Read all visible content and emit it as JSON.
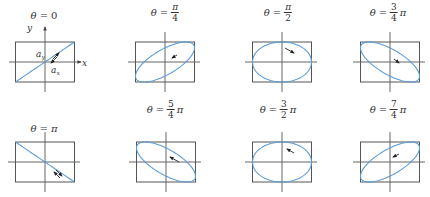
{
  "diagram": {
    "colors": {
      "frame": "#555555",
      "axis": "#555555",
      "curve": "#5b9bd5",
      "arrow": "#222222",
      "text": "#333333"
    },
    "axis_labels": {
      "x": "x",
      "y": "y",
      "ax": "a",
      "ax_sub": "x",
      "ay": "a",
      "ay_sub": "y"
    },
    "box": {
      "width": 59,
      "height": 40
    },
    "panels": [
      {
        "id": "p0",
        "label_var": "θ",
        "label_eq": "=",
        "num": "",
        "den": "",
        "plain": "0",
        "pi": "",
        "phase": 0,
        "cx": 45,
        "cy": 62,
        "label_x": 44,
        "label_y": 4,
        "arrow": "double-ne"
      },
      {
        "id": "p1",
        "label_var": "θ",
        "label_eq": "=",
        "num": "π",
        "den": "4",
        "plain": "",
        "pi": "",
        "phase": 0.25,
        "cx": 165,
        "cy": 62,
        "label_x": 165,
        "label_y": 2,
        "arrow": "ccw"
      },
      {
        "id": "p2",
        "label_var": "θ",
        "label_eq": "=",
        "num": "π",
        "den": "2",
        "plain": "",
        "pi": "",
        "phase": 0.5,
        "cx": 282,
        "cy": 62,
        "label_x": 278,
        "label_y": 2,
        "arrow": "cw-right"
      },
      {
        "id": "p3",
        "label_var": "θ",
        "label_eq": "=",
        "num": "3",
        "den": "4",
        "plain": "",
        "pi": "π",
        "phase": 0.75,
        "cx": 390,
        "cy": 62,
        "label_x": 388,
        "label_y": 2,
        "arrow": "cw-down"
      },
      {
        "id": "p4",
        "label_var": "θ",
        "label_eq": "=",
        "num": "",
        "den": "",
        "plain": "π",
        "pi": "",
        "phase": 1.0,
        "cx": 45,
        "cy": 162,
        "label_x": 44,
        "label_y": 117,
        "arrow": "double-se"
      },
      {
        "id": "p5",
        "label_var": "θ",
        "label_eq": "=",
        "num": "5",
        "den": "4",
        "plain": "",
        "pi": "π",
        "phase": 1.25,
        "cx": 166,
        "cy": 162,
        "label_x": 165,
        "label_y": 99,
        "arrow": "ccw-down"
      },
      {
        "id": "p6",
        "label_var": "θ",
        "label_eq": "=",
        "num": "3",
        "den": "2",
        "plain": "",
        "pi": "π",
        "phase": 1.5,
        "cx": 282,
        "cy": 162,
        "label_x": 278,
        "label_y": 99,
        "arrow": "ccw-left"
      },
      {
        "id": "p7",
        "label_var": "θ",
        "label_eq": "=",
        "num": "7",
        "den": "4",
        "plain": "",
        "pi": "π",
        "phase": 1.75,
        "cx": 390,
        "cy": 162,
        "label_x": 388,
        "label_y": 99,
        "arrow": "ccw-upleft"
      }
    ]
  }
}
